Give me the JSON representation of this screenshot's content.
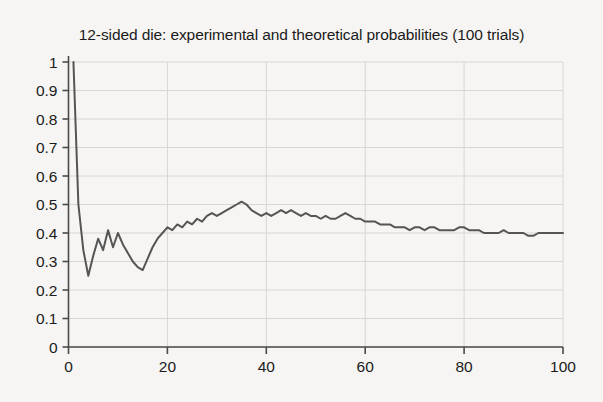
{
  "chart_data": {
    "type": "line",
    "title": "12-sided die: experimental and theoretical probabilities (100 trials)",
    "xlabel": "",
    "ylabel": "",
    "xlim": [
      0,
      100
    ],
    "ylim": [
      0,
      1
    ],
    "xticks": [
      0,
      20,
      40,
      60,
      80,
      100
    ],
    "yticks": [
      0,
      0.1,
      0.2,
      0.3,
      0.4,
      0.5,
      0.6,
      0.7,
      0.8,
      0.9,
      1
    ],
    "xtick_labels": [
      "0",
      "20",
      "40",
      "60",
      "80",
      "100"
    ],
    "ytick_labels": [
      "0",
      "0.1",
      "0.2",
      "0.3",
      "0.4",
      "0.5",
      "0.6",
      "0.7",
      "0.8",
      "0.9",
      "1"
    ],
    "grid": true,
    "legend": "none",
    "line_color": "#555555",
    "series": [
      {
        "name": "experimental probability",
        "x": [
          1,
          2,
          3,
          4,
          5,
          6,
          7,
          8,
          9,
          10,
          11,
          12,
          13,
          14,
          15,
          16,
          17,
          18,
          19,
          20,
          21,
          22,
          23,
          24,
          25,
          26,
          27,
          28,
          29,
          30,
          31,
          32,
          33,
          34,
          35,
          36,
          37,
          38,
          39,
          40,
          41,
          42,
          43,
          44,
          45,
          46,
          47,
          48,
          49,
          50,
          51,
          52,
          53,
          54,
          55,
          56,
          57,
          58,
          59,
          60,
          61,
          62,
          63,
          64,
          65,
          66,
          67,
          68,
          69,
          70,
          71,
          72,
          73,
          74,
          75,
          76,
          77,
          78,
          79,
          80,
          81,
          82,
          83,
          84,
          85,
          86,
          87,
          88,
          89,
          90,
          91,
          92,
          93,
          94,
          95,
          96,
          97,
          98,
          99,
          100
        ],
        "values": [
          1.0,
          0.5,
          0.34,
          0.25,
          0.32,
          0.38,
          0.34,
          0.41,
          0.35,
          0.4,
          0.36,
          0.33,
          0.3,
          0.28,
          0.27,
          0.31,
          0.35,
          0.38,
          0.4,
          0.42,
          0.41,
          0.43,
          0.42,
          0.44,
          0.43,
          0.45,
          0.44,
          0.46,
          0.47,
          0.46,
          0.47,
          0.48,
          0.49,
          0.5,
          0.51,
          0.5,
          0.48,
          0.47,
          0.46,
          0.47,
          0.46,
          0.47,
          0.48,
          0.47,
          0.48,
          0.47,
          0.46,
          0.47,
          0.46,
          0.46,
          0.45,
          0.46,
          0.45,
          0.45,
          0.46,
          0.47,
          0.46,
          0.45,
          0.45,
          0.44,
          0.44,
          0.44,
          0.43,
          0.43,
          0.43,
          0.42,
          0.42,
          0.42,
          0.41,
          0.42,
          0.42,
          0.41,
          0.42,
          0.42,
          0.41,
          0.41,
          0.41,
          0.41,
          0.42,
          0.42,
          0.41,
          0.41,
          0.41,
          0.4,
          0.4,
          0.4,
          0.4,
          0.41,
          0.4,
          0.4,
          0.4,
          0.4,
          0.39,
          0.39,
          0.4,
          0.4,
          0.4,
          0.4,
          0.4,
          0.4
        ]
      }
    ]
  }
}
